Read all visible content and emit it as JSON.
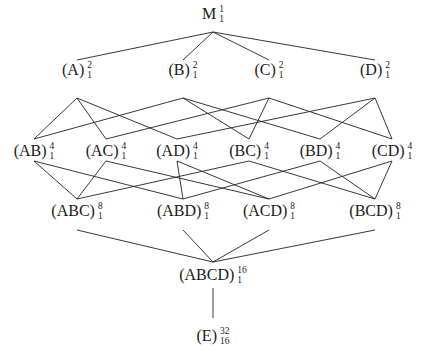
{
  "diagram": {
    "type": "hasse-diagram",
    "nodes": [
      {
        "id": "M",
        "label": "M",
        "sup": "1",
        "sub": "1",
        "x": 213,
        "y": 14,
        "top": 13,
        "bottom": 32
      },
      {
        "id": "A",
        "label": "(A)",
        "sup": "2",
        "sub": "1",
        "x": 77,
        "y": 70,
        "top": 60,
        "bottom": 98
      },
      {
        "id": "B",
        "label": "(B)",
        "sup": "2",
        "sub": "1",
        "x": 183,
        "y": 70,
        "top": 60,
        "bottom": 98
      },
      {
        "id": "C",
        "label": "(C)",
        "sup": "2",
        "sub": "1",
        "x": 269,
        "y": 70,
        "top": 60,
        "bottom": 98
      },
      {
        "id": "D",
        "label": "(D)",
        "sup": "2",
        "sub": "1",
        "x": 375,
        "y": 70,
        "top": 60,
        "bottom": 98
      },
      {
        "id": "AB",
        "label": "(AB)",
        "sup": "4",
        "sub": "1",
        "x": 34,
        "y": 151,
        "top": 139,
        "bottom": 161
      },
      {
        "id": "AC",
        "label": "(AC)",
        "sup": "4",
        "sub": "1",
        "x": 106,
        "y": 151,
        "top": 139,
        "bottom": 161
      },
      {
        "id": "AD",
        "label": "(AD)",
        "sup": "4",
        "sub": "1",
        "x": 177,
        "y": 151,
        "top": 139,
        "bottom": 161
      },
      {
        "id": "BC",
        "label": "(BC)",
        "sup": "4",
        "sub": "1",
        "x": 249,
        "y": 151,
        "top": 139,
        "bottom": 161
      },
      {
        "id": "BD",
        "label": "(BD)",
        "sup": "4",
        "sub": "1",
        "x": 320,
        "y": 151,
        "top": 139,
        "bottom": 161
      },
      {
        "id": "CD",
        "label": "(CD)",
        "sup": "4",
        "sub": "1",
        "x": 392,
        "y": 151,
        "top": 139,
        "bottom": 161
      },
      {
        "id": "ABC",
        "label": "(ABC)",
        "sup": "8",
        "sub": "1",
        "x": 77,
        "y": 211,
        "top": 199,
        "bottom": 230
      },
      {
        "id": "ABD",
        "label": "(ABD)",
        "sup": "8",
        "sub": "1",
        "x": 183,
        "y": 211,
        "top": 199,
        "bottom": 230
      },
      {
        "id": "ACD",
        "label": "(ACD)",
        "sup": "8",
        "sub": "1",
        "x": 269,
        "y": 211,
        "top": 199,
        "bottom": 230
      },
      {
        "id": "BCD",
        "label": "(BCD)",
        "sup": "8",
        "sub": "1",
        "x": 375,
        "y": 211,
        "top": 199,
        "bottom": 230
      },
      {
        "id": "ABCD",
        "label": "(ABCD)",
        "sup": "16",
        "sub": "1",
        "x": 213,
        "y": 275,
        "top": 262,
        "bottom": 288
      },
      {
        "id": "E",
        "label": "(E)",
        "sup": "32",
        "sub": "16",
        "x": 213,
        "y": 336,
        "top": 318,
        "bottom": 318
      }
    ],
    "edges": [
      [
        "M",
        "A"
      ],
      [
        "M",
        "B"
      ],
      [
        "M",
        "C"
      ],
      [
        "M",
        "D"
      ],
      [
        "A",
        "AB"
      ],
      [
        "A",
        "AC"
      ],
      [
        "A",
        "AD"
      ],
      [
        "B",
        "AB"
      ],
      [
        "B",
        "BC"
      ],
      [
        "B",
        "BD"
      ],
      [
        "C",
        "AC"
      ],
      [
        "C",
        "BC"
      ],
      [
        "C",
        "CD"
      ],
      [
        "D",
        "AD"
      ],
      [
        "D",
        "BD"
      ],
      [
        "D",
        "CD"
      ],
      [
        "AB",
        "ABC"
      ],
      [
        "AB",
        "ABD"
      ],
      [
        "AC",
        "ABC"
      ],
      [
        "AC",
        "ACD"
      ],
      [
        "AD",
        "ABD"
      ],
      [
        "AD",
        "ACD"
      ],
      [
        "BC",
        "ABC"
      ],
      [
        "BC",
        "BCD"
      ],
      [
        "BD",
        "ABD"
      ],
      [
        "BD",
        "BCD"
      ],
      [
        "CD",
        "ACD"
      ],
      [
        "CD",
        "BCD"
      ],
      [
        "ABC",
        "ABCD"
      ],
      [
        "ABD",
        "ABCD"
      ],
      [
        "ACD",
        "ABCD"
      ],
      [
        "BCD",
        "ABCD"
      ],
      [
        "ABCD",
        "E"
      ]
    ]
  }
}
